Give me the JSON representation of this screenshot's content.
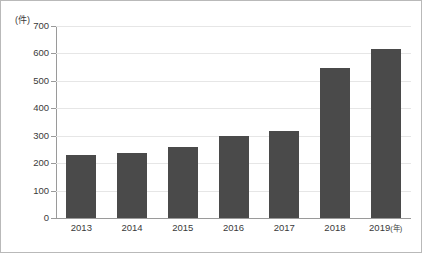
{
  "chart_data": {
    "type": "bar",
    "title": "",
    "xlabel": "年",
    "ylabel": "件",
    "unit_label": "(件)",
    "axis_unit_suffix": "(年)",
    "categories": [
      "2013",
      "2014",
      "2015",
      "2016",
      "2017",
      "2018",
      "2019"
    ],
    "values": [
      231,
      236,
      259,
      300,
      318,
      548,
      618
    ],
    "ylim": [
      0,
      700
    ],
    "ytick_step": 100,
    "yticks": [
      0,
      100,
      200,
      300,
      400,
      500,
      600,
      700
    ],
    "ytick_labels": [
      "0",
      "100",
      "200",
      "300",
      "400",
      "500",
      "600",
      "700"
    ],
    "grid": true,
    "legend": false,
    "legend_position": "none",
    "series": [
      {
        "name": "件数",
        "values": [
          231,
          236,
          259,
          300,
          318,
          548,
          618
        ]
      }
    ],
    "colors": {
      "bar": "#4a4a4a",
      "gridline": "#e6e6e6",
      "axis": "#9a9a9a",
      "frame": "#b9b9b9",
      "text": "#3a3a3a",
      "background": "#ffffff"
    }
  }
}
